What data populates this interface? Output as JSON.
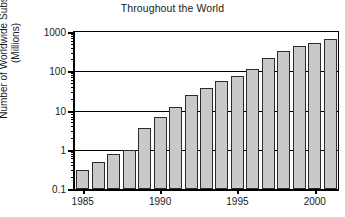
{
  "chart_data": {
    "type": "bar",
    "title": "Throughout the World",
    "xlabel": "",
    "ylabel": "Number of Worldwide Subscribers",
    "ylabel_line2": "(Millions)",
    "yscale": "log",
    "ylim": [
      0.1,
      1000
    ],
    "xlim": [
      1984.5,
      2001.5
    ],
    "grid": "horizontal-major",
    "legend": "none",
    "ytick_labels": [
      "1000",
      "100",
      "10",
      "1",
      "0.1"
    ],
    "ytick_values": [
      1000,
      100,
      10,
      1,
      0.1
    ],
    "xtick_labels": [
      "1985",
      "1990",
      "1995",
      "2000"
    ],
    "xtick_values": [
      1985,
      1990,
      1995,
      2000
    ],
    "categories": [
      "1985",
      "1986",
      "1987",
      "1988",
      "1989",
      "1990",
      "1991",
      "1992",
      "1993",
      "1994",
      "1995",
      "1996",
      "1997",
      "1998",
      "1999",
      "2000",
      "2001"
    ],
    "values": [
      0.3,
      0.5,
      0.8,
      1.0,
      3.5,
      7.0,
      12.0,
      25.0,
      38.0,
      55.0,
      75.0,
      115.0,
      215.0,
      320.0,
      430.0,
      510.0,
      650.0
    ],
    "bar_fill_color": "#c9c9c9",
    "bar_edge_color": "#2b2b2b",
    "axis_color": "#000000",
    "background_color": "#ffffff"
  }
}
